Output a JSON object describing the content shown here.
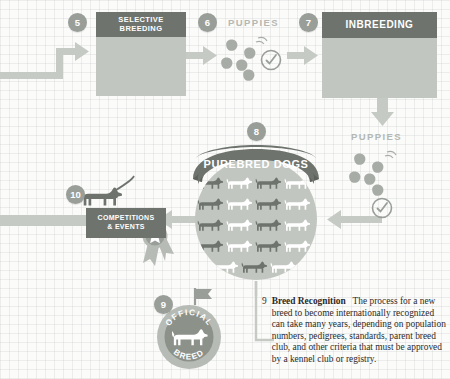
{
  "diagram": {
    "colors": {
      "header_dark": "#6e746d",
      "panel_fill": "#c2c6c0",
      "arrow_gray": "#c6cac4",
      "badge_gray": "#9a9e98",
      "label_gray": "#b4b8b2",
      "dog_dark": "#6e746d",
      "dog_light": "#ffffff",
      "text_dark": "#2b2b2b",
      "background": "#fbfbfa"
    },
    "steps": [
      {
        "number": "5",
        "title": "SELECTIVE\nBREEDING",
        "title_line1": "SELECTIVE",
        "title_line2": "BREEDING",
        "icons": [
          "dog-dark",
          "dog-light",
          "syringe"
        ]
      },
      {
        "number": "6",
        "label": "PUPPIES",
        "icons": [
          "puppy-cluster",
          "check-circle"
        ]
      },
      {
        "number": "7",
        "title": "INBREEDING",
        "icons": [
          "pedigree-tree"
        ]
      },
      {
        "number": "8",
        "banner": "PUREBRED DOGS",
        "grid_rows": 5,
        "grid_cols": 4,
        "dog_pattern": "alternating-dark-light"
      },
      {
        "number": "9",
        "badge_top": "OFFICIAL",
        "badge_bottom": "BREED",
        "heading": "Breed Recognition",
        "body": "The process for a new breed to become internationally recognized can take many years, depending on population numbers, pedigrees, standards, parent breed club, and other criteria that must be approved by a kennel club or registry.",
        "lines": [
          "Breed Recognition   The process for a",
          "new breed to become internationally",
          "recognized can take many years,",
          "depending on population numbers,",
          "pedigrees, standards, parent breed",
          "club, and other criteria that must be",
          "approved by a kennel club or registry."
        ]
      },
      {
        "number": "10",
        "title_line1": "COMPETITIONS",
        "title_line2": "& EVENTS",
        "icons": [
          "dog-on-leash",
          "award-rosette"
        ]
      }
    ],
    "secondary_puppies": {
      "label": "PUPPIES",
      "icons": [
        "puppy-cluster",
        "check-circle"
      ]
    }
  }
}
